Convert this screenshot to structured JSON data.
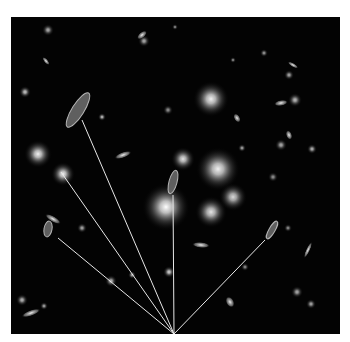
{
  "image": {
    "subject": "galaxy cluster with gravitationally lensed arcs",
    "background_color": "#030303",
    "frame_color": "#ffffff",
    "line_color": "#e8e8e8"
  },
  "convergence_point": {
    "x": 163,
    "y": 317
  },
  "lines": [
    {
      "name": "line-to-upper-left-arc",
      "x1": 71,
      "y1": 103
    },
    {
      "name": "line-to-left-galaxy",
      "x1": 50,
      "y1": 155
    },
    {
      "name": "line-to-lower-left-arc",
      "x1": 47,
      "y1": 221
    },
    {
      "name": "line-to-center-arc",
      "x1": 162,
      "y1": 178
    },
    {
      "name": "line-to-right-arc",
      "x1": 254,
      "y1": 223
    }
  ],
  "arcs": [
    {
      "cx": 67,
      "cy": 93,
      "rx": 6,
      "ry": 20,
      "rot": 32
    },
    {
      "cx": 37,
      "cy": 212,
      "rx": 4,
      "ry": 8,
      "rot": 10
    },
    {
      "cx": 162,
      "cy": 165,
      "rx": 4,
      "ry": 12,
      "rot": 15
    },
    {
      "cx": 261,
      "cy": 213,
      "rx": 3,
      "ry": 10,
      "rot": 30
    }
  ],
  "galaxies": [
    {
      "cx": 200,
      "cy": 82,
      "r": 18,
      "b": 0.95
    },
    {
      "cx": 207,
      "cy": 152,
      "r": 22,
      "b": 0.95
    },
    {
      "cx": 172,
      "cy": 142,
      "r": 12,
      "b": 0.9
    },
    {
      "cx": 155,
      "cy": 190,
      "r": 24,
      "b": 1.0
    },
    {
      "cx": 200,
      "cy": 195,
      "r": 16,
      "b": 0.9
    },
    {
      "cx": 222,
      "cy": 180,
      "r": 14,
      "b": 0.85
    },
    {
      "cx": 27,
      "cy": 137,
      "r": 14,
      "b": 0.95
    },
    {
      "cx": 52,
      "cy": 157,
      "r": 12,
      "b": 0.95
    },
    {
      "cx": 37,
      "cy": 13,
      "r": 6,
      "b": 0.7
    },
    {
      "cx": 133,
      "cy": 24,
      "r": 6,
      "b": 0.7
    },
    {
      "cx": 14,
      "cy": 75,
      "r": 6,
      "b": 0.8
    },
    {
      "cx": 91,
      "cy": 100,
      "r": 4,
      "b": 0.8
    },
    {
      "cx": 278,
      "cy": 58,
      "r": 5,
      "b": 0.7
    },
    {
      "cx": 284,
      "cy": 83,
      "r": 7,
      "b": 0.75
    },
    {
      "cx": 270,
      "cy": 128,
      "r": 6,
      "b": 0.7
    },
    {
      "cx": 262,
      "cy": 160,
      "r": 5,
      "b": 0.6
    },
    {
      "cx": 71,
      "cy": 211,
      "r": 5,
      "b": 0.7
    },
    {
      "cx": 11,
      "cy": 283,
      "r": 6,
      "b": 0.75
    },
    {
      "cx": 33,
      "cy": 289,
      "r": 4,
      "b": 0.7
    },
    {
      "cx": 100,
      "cy": 264,
      "r": 6,
      "b": 0.75
    },
    {
      "cx": 121,
      "cy": 258,
      "r": 4,
      "b": 0.7
    },
    {
      "cx": 158,
      "cy": 255,
      "r": 6,
      "b": 0.85
    },
    {
      "cx": 157,
      "cy": 93,
      "r": 5,
      "b": 0.6
    },
    {
      "cx": 231,
      "cy": 131,
      "r": 4,
      "b": 0.7
    },
    {
      "cx": 286,
      "cy": 275,
      "r": 6,
      "b": 0.7
    },
    {
      "cx": 301,
      "cy": 132,
      "r": 5,
      "b": 0.75
    },
    {
      "cx": 164,
      "cy": 10,
      "r": 3,
      "b": 0.6
    },
    {
      "cx": 222,
      "cy": 43,
      "r": 3,
      "b": 0.6
    },
    {
      "cx": 253,
      "cy": 36,
      "r": 4,
      "b": 0.65
    },
    {
      "cx": 234,
      "cy": 250,
      "r": 4,
      "b": 0.6
    },
    {
      "cx": 300,
      "cy": 287,
      "r": 5,
      "b": 0.7
    },
    {
      "cx": 277,
      "cy": 211,
      "r": 4,
      "b": 0.6
    }
  ],
  "ellipses": [
    {
      "cx": 20,
      "cy": 296,
      "rx": 10,
      "ry": 3,
      "rot": -20
    },
    {
      "cx": 42,
      "cy": 202,
      "rx": 9,
      "ry": 3,
      "rot": 30
    },
    {
      "cx": 112,
      "cy": 138,
      "rx": 9,
      "ry": 3,
      "rot": -20
    },
    {
      "cx": 190,
      "cy": 228,
      "rx": 9,
      "ry": 3,
      "rot": 5
    },
    {
      "cx": 270,
      "cy": 86,
      "rx": 7,
      "ry": 3,
      "rot": -10
    },
    {
      "cx": 278,
      "cy": 118,
      "rx": 5,
      "ry": 3,
      "rot": 70
    },
    {
      "cx": 131,
      "cy": 18,
      "rx": 6,
      "ry": 3,
      "rot": -40
    },
    {
      "cx": 297,
      "cy": 233,
      "rx": 2,
      "ry": 9,
      "rot": 25
    },
    {
      "cx": 35,
      "cy": 44,
      "rx": 5,
      "ry": 2,
      "rot": 50
    },
    {
      "cx": 219,
      "cy": 285,
      "rx": 6,
      "ry": 4,
      "rot": 60
    },
    {
      "cx": 226,
      "cy": 101,
      "rx": 3,
      "ry": 5,
      "rot": -30
    },
    {
      "cx": 282,
      "cy": 48,
      "rx": 6,
      "ry": 2,
      "rot": 30
    }
  ]
}
